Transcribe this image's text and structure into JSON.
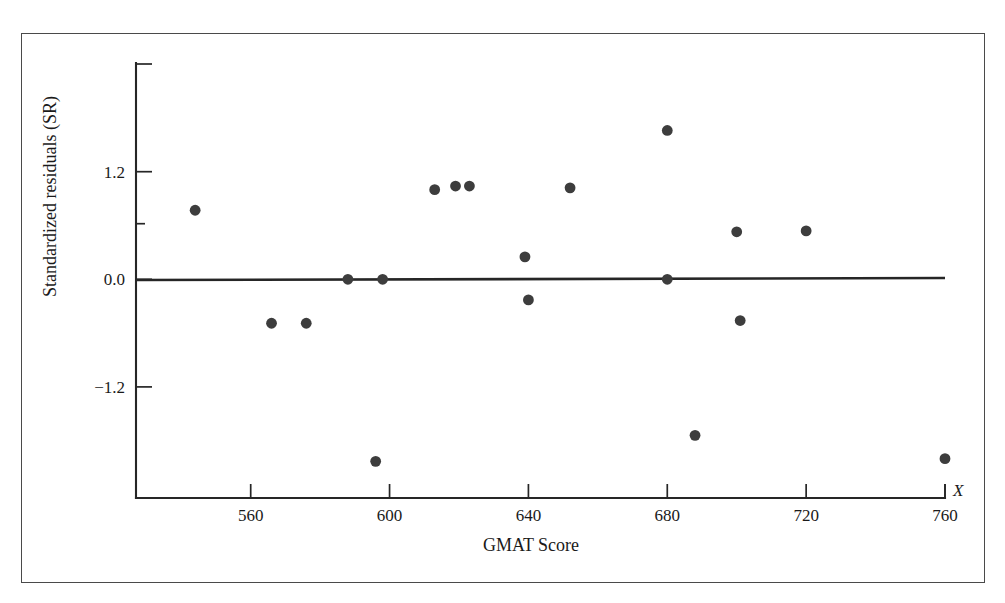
{
  "figure": {
    "background_color": "#ffffff",
    "frame_color": "#4a4a4a",
    "ink_color": "#262626",
    "marker_color": "#3d3d3d"
  },
  "axis": {
    "x_variable_symbol": "X",
    "x_title": "GMAT Score",
    "y_title": "Standardized residuals (SR)",
    "x_ticks": [
      {
        "label": "560",
        "value": 560
      },
      {
        "label": "600",
        "value": 600
      },
      {
        "label": "640",
        "value": 640
      },
      {
        "label": "680",
        "value": 680
      },
      {
        "label": "720",
        "value": 720
      },
      {
        "label": "760",
        "value": 760
      }
    ],
    "y_ticks": [
      {
        "label": "1.2",
        "value": 1.2
      },
      {
        "label": "0.0",
        "value": 0.0
      },
      {
        "label": "−1.2",
        "value": -1.2
      }
    ]
  },
  "chart_data": {
    "type": "scatter",
    "title": "",
    "xlabel": "GMAT Score",
    "ylabel": "Standardized residuals (SR)",
    "xlim": [
      536,
      766
    ],
    "ylim": [
      -2.45,
      2.42
    ],
    "grid": false,
    "legend": null,
    "reference_line": {
      "type": "horizontal",
      "y": 0.0,
      "label": "zero residual line"
    },
    "x": [
      544,
      566,
      576,
      588,
      596,
      598,
      613,
      619,
      623,
      639,
      640,
      652,
      680,
      680,
      688,
      700,
      720,
      760
    ],
    "y": [
      0.77,
      -0.49,
      -0.49,
      0.0,
      -2.03,
      0.0,
      1.0,
      1.04,
      1.04,
      0.25,
      -0.23,
      1.02,
      -1.74,
      1.66,
      0.53,
      -0.46,
      0.54,
      -2.0
    ],
    "points": [
      {
        "x": 544,
        "y": 0.77
      },
      {
        "x": 566,
        "y": -0.49
      },
      {
        "x": 576,
        "y": -0.49
      },
      {
        "x": 588,
        "y": 0.0
      },
      {
        "x": 596,
        "y": -2.03
      },
      {
        "x": 598,
        "y": 0.0
      },
      {
        "x": 613,
        "y": 1.0
      },
      {
        "x": 619,
        "y": 1.04
      },
      {
        "x": 623,
        "y": 1.04
      },
      {
        "x": 639,
        "y": 0.25
      },
      {
        "x": 640,
        "y": -0.23
      },
      {
        "x": 652,
        "y": 1.02
      },
      {
        "x": 680,
        "y": 1.66
      },
      {
        "x": 680,
        "y": 0.0
      },
      {
        "x": 688,
        "y": -1.74
      },
      {
        "x": 700,
        "y": 0.53
      },
      {
        "x": 701,
        "y": -0.46
      },
      {
        "x": 720,
        "y": 0.54
      },
      {
        "x": 760,
        "y": -2.0
      }
    ],
    "marker": "filled-circle",
    "marker_count": 19
  }
}
